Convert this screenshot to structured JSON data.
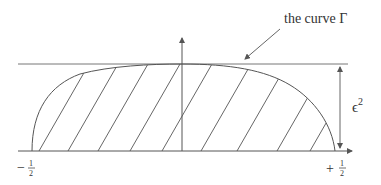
{
  "diagram": {
    "curve_label": "the curve Γ",
    "epsilon_label": "ϵ",
    "epsilon_exponent": "2",
    "left_tick": {
      "sign": "−",
      "numerator": "1",
      "denominator": "2"
    },
    "right_tick": {
      "sign": "+",
      "numerator": "1",
      "denominator": "2"
    },
    "colors": {
      "line": "#555555",
      "text": "#333333",
      "background": "#ffffff"
    }
  }
}
